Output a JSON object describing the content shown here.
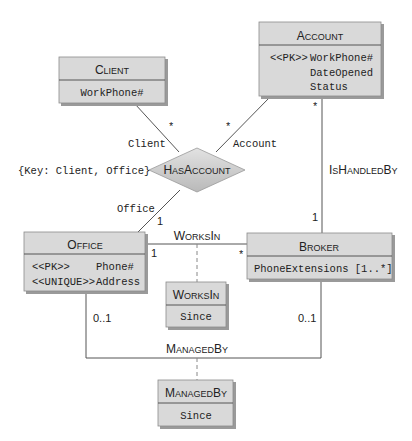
{
  "diagram": {
    "type": "UML class diagram (ER)",
    "colors": {
      "box_fill": "#d9d9d9",
      "box_shadow": "#9a9a9a",
      "box_border": "#8c8c8c",
      "line": "#555555",
      "text": "#222222"
    },
    "entities": [
      {
        "id": "client",
        "title_first": "C",
        "title_rest": "LIENT",
        "attributes": [
          {
            "stereotype": "",
            "name": "WorkPhone#"
          }
        ]
      },
      {
        "id": "account",
        "title_first": "A",
        "title_rest": "CCOUNT",
        "attributes": [
          {
            "stereotype": "<<PK>>",
            "name": "WorkPhone#"
          },
          {
            "stereotype": "",
            "name": "DateOpened"
          },
          {
            "stereotype": "",
            "name": "Status"
          }
        ]
      },
      {
        "id": "office",
        "title_first": "O",
        "title_rest": "FFICE",
        "attributes": [
          {
            "stereotype": "<<PK>>",
            "name": "Phone#"
          },
          {
            "stereotype": "<<UNIQUE>>",
            "name": "Address"
          }
        ]
      },
      {
        "id": "broker",
        "title_first": "B",
        "title_rest": "ROKER",
        "attributes": [
          {
            "stereotype": "",
            "name": "PhoneExtensions [1..*]"
          }
        ]
      },
      {
        "id": "worksin_class",
        "title_first": "W",
        "title_rest": "ORKS",
        "title_first2": "I",
        "title_rest2": "N",
        "attributes": [
          {
            "stereotype": "",
            "name": "Since"
          }
        ]
      },
      {
        "id": "managedby_class",
        "title_first": "M",
        "title_rest": "ANAGED",
        "title_first2": "B",
        "title_rest2": "Y",
        "attributes": [
          {
            "stereotype": "",
            "name": "Since"
          }
        ]
      }
    ],
    "relationships": {
      "hasaccount": {
        "label_first": "H",
        "label_rest": "AS",
        "label_first2": "A",
        "label_rest2": "CCOUNT",
        "key_note": "{Key: Client, Office}",
        "roles": {
          "client": {
            "role": "Client",
            "multiplicity": "*"
          },
          "account": {
            "role": "Account",
            "multiplicity": "*"
          },
          "office": {
            "role": "Office",
            "multiplicity": "1"
          }
        }
      },
      "ishandledby": {
        "label_first": "I",
        "label_rest": "S",
        "label_first2": "H",
        "label_rest2": "ANDLED",
        "label_first3": "B",
        "label_rest3": "Y",
        "account_multiplicity": "*",
        "broker_multiplicity": "1"
      },
      "worksin": {
        "label_first": "W",
        "label_rest": "ORKS",
        "label_first2": "I",
        "label_rest2": "N",
        "office_multiplicity": "1",
        "broker_multiplicity": "*"
      },
      "managedby": {
        "label_first": "M",
        "label_rest": "ANAGED",
        "label_first2": "B",
        "label_rest2": "Y",
        "office_multiplicity": "0..1",
        "broker_multiplicity": "0..1"
      }
    }
  }
}
